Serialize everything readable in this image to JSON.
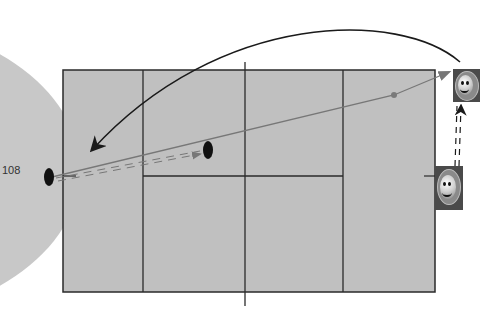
{
  "page": {
    "page_number": "108"
  },
  "diagram": {
    "court_color": "#c0c0c0",
    "line_color": "#2a2a2a",
    "elements": {
      "players": [
        {
          "id": "player-top-right",
          "icon": "smiley-player-icon"
        },
        {
          "id": "player-bottom-right",
          "icon": "smiley-player-icon"
        }
      ],
      "balls": [
        {
          "id": "ball-left-baseline",
          "icon": "ball-marker-icon"
        },
        {
          "id": "ball-short-midcourt",
          "icon": "ball-marker-icon"
        }
      ],
      "paths": [
        {
          "id": "lob-curve-arrow",
          "style": "solid black curved"
        },
        {
          "id": "shot-line",
          "style": "solid gray"
        },
        {
          "id": "player-movement-left",
          "style": "dashed double gray"
        },
        {
          "id": "player-movement-right",
          "style": "dashed double black"
        }
      ]
    }
  }
}
